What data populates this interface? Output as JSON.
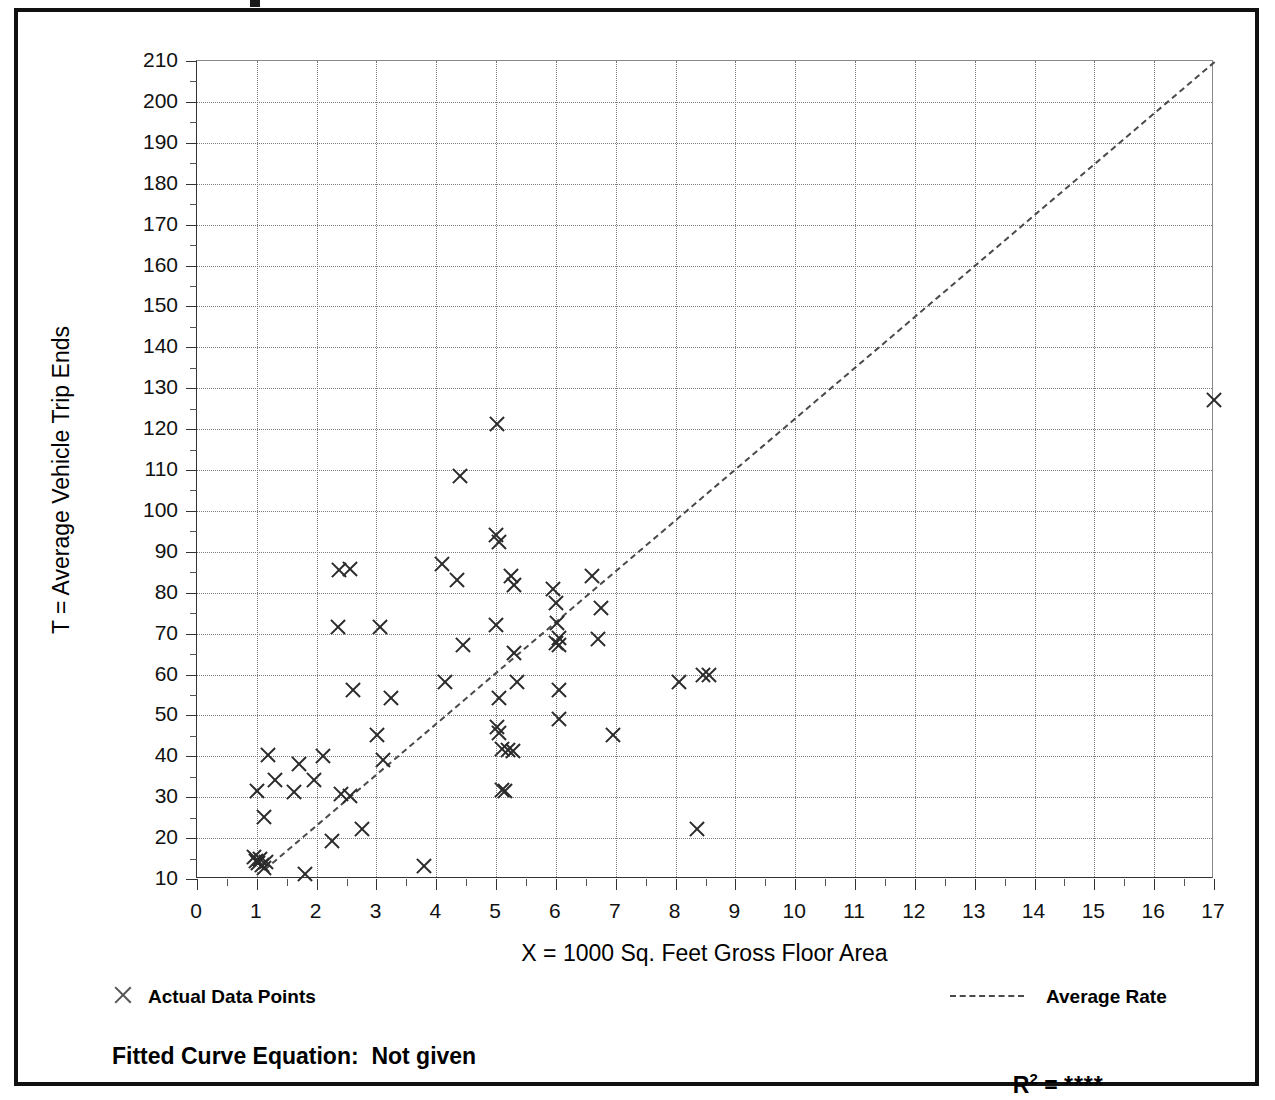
{
  "figure": {
    "frame_color": "#111111",
    "background": "#ffffff"
  },
  "legend": {
    "data_points_label": "Actual Data Points",
    "average_rate_label": "Average Rate",
    "data_point_marker": "x-marker-icon",
    "average_rate_marker": "dashed-line-icon"
  },
  "footer": {
    "fitted_curve_text": "Fitted Curve Equation:  Not given",
    "r2_prefix": "R",
    "r2_exponent": "2",
    "r2_equals": " = ",
    "r2_value": "****"
  },
  "chart_data": {
    "type": "scatter",
    "title": "",
    "xlabel": "X = 1000 Sq. Feet Gross Floor Area",
    "ylabel": "T = Average Vehicle Trip Ends",
    "xlim": [
      0,
      17
    ],
    "ylim": [
      10,
      210
    ],
    "xticks": [
      0,
      1,
      2,
      3,
      4,
      5,
      6,
      7,
      8,
      9,
      10,
      11,
      12,
      13,
      14,
      15,
      16,
      17
    ],
    "yticks": [
      10,
      20,
      30,
      40,
      50,
      60,
      70,
      80,
      90,
      100,
      110,
      120,
      130,
      140,
      150,
      160,
      170,
      180,
      190,
      200,
      210
    ],
    "x_minor_step": 0.5,
    "y_minor_step": 5,
    "grid": true,
    "grid_style": "dotted",
    "legend_position": "below-plot",
    "series": [
      {
        "name": "Actual Data Points",
        "marker": "x",
        "color": "#2b2b2b",
        "points": [
          [
            0.95,
            15.5
          ],
          [
            0.98,
            14.5
          ],
          [
            1.02,
            14.0
          ],
          [
            1.05,
            15.0
          ],
          [
            1.08,
            13.5
          ],
          [
            1.12,
            12.8
          ],
          [
            1.15,
            14.2
          ],
          [
            1.0,
            31.5
          ],
          [
            1.12,
            25.2
          ],
          [
            1.18,
            40.2
          ],
          [
            1.3,
            34.2
          ],
          [
            1.62,
            31.2
          ],
          [
            1.7,
            38.0
          ],
          [
            1.8,
            11.2
          ],
          [
            1.95,
            34.2
          ],
          [
            2.1,
            40.0
          ],
          [
            2.25,
            19.2
          ],
          [
            2.35,
            71.5
          ],
          [
            2.38,
            85.5
          ],
          [
            2.55,
            85.8
          ],
          [
            2.4,
            30.8
          ],
          [
            2.55,
            30.2
          ],
          [
            2.6,
            56.2
          ],
          [
            2.75,
            22.2
          ],
          [
            3.0,
            45.2
          ],
          [
            3.05,
            71.5
          ],
          [
            3.1,
            39.2
          ],
          [
            3.25,
            54.2
          ],
          [
            3.8,
            13.2
          ],
          [
            4.1,
            87.0
          ],
          [
            4.15,
            58.2
          ],
          [
            4.35,
            83.0
          ],
          [
            4.4,
            108.5
          ],
          [
            4.45,
            67.2
          ],
          [
            5.02,
            121.2
          ],
          [
            5.0,
            94.0
          ],
          [
            5.05,
            92.5
          ],
          [
            5.0,
            72.2
          ],
          [
            5.05,
            54.2
          ],
          [
            5.02,
            47.2
          ],
          [
            5.05,
            45.8
          ],
          [
            5.1,
            41.8
          ],
          [
            5.2,
            41.5
          ],
          [
            5.28,
            41.2
          ],
          [
            5.1,
            31.8
          ],
          [
            5.15,
            31.5
          ],
          [
            5.25,
            84.2
          ],
          [
            5.3,
            81.8
          ],
          [
            5.35,
            58.2
          ],
          [
            5.3,
            65.2
          ],
          [
            5.95,
            81.0
          ],
          [
            6.0,
            77.5
          ],
          [
            6.02,
            72.5
          ],
          [
            6.05,
            69.0
          ],
          [
            6.0,
            67.8
          ],
          [
            6.05,
            67.2
          ],
          [
            6.05,
            56.2
          ],
          [
            6.05,
            49.2
          ],
          [
            6.6,
            84.0
          ],
          [
            6.7,
            68.8
          ],
          [
            6.75,
            76.2
          ],
          [
            6.95,
            45.2
          ],
          [
            8.05,
            58.2
          ],
          [
            8.35,
            22.2
          ],
          [
            8.45,
            59.8
          ],
          [
            8.55,
            60.0
          ],
          [
            17.0,
            127.0
          ]
        ]
      },
      {
        "name": "Average Rate",
        "type": "line",
        "style": "dashed",
        "color": "#4a4a4a",
        "endpoints": [
          [
            1.12,
            12.5
          ],
          [
            17.0,
            210.0
          ]
        ]
      }
    ]
  }
}
